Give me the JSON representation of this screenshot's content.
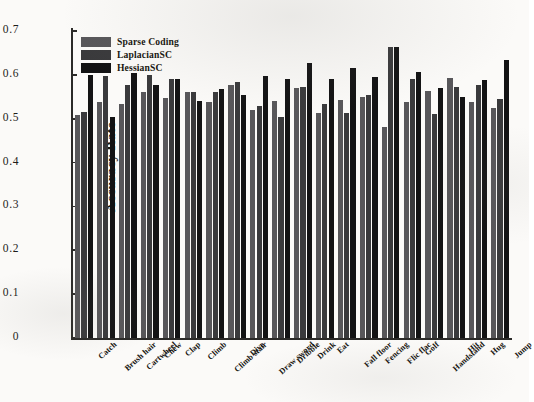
{
  "chart_data": {
    "type": "bar",
    "title": "",
    "subtitle": "",
    "xlabel": "",
    "ylabel": "Accuracy Rate",
    "ylim": [
      0,
      0.7
    ],
    "yticks": [
      "0",
      "0.1",
      "0.2",
      "0.3",
      "0.4",
      "0.5",
      "0.6",
      "0.7"
    ],
    "ytick_values": [
      0,
      0.1,
      0.2,
      0.3,
      0.4,
      0.5,
      0.6,
      0.7
    ],
    "grid": false,
    "legend_position": "top-left",
    "categories": [
      "Catch",
      "Brush hair",
      "Cartwheel",
      "Chew",
      "Clap",
      "Climb",
      "Climb stair",
      "Dive",
      "Draw sword",
      "Dribble",
      "Drink",
      "Eat",
      "Fall floor",
      "Fencing",
      "Flic flac",
      "Golf",
      "Handstand",
      "Hit",
      "Hug",
      "Jump"
    ],
    "series": [
      {
        "name": "Sparse Coding",
        "color": "#58575a",
        "values": [
          0.508,
          0.538,
          0.533,
          0.561,
          0.548,
          0.562,
          0.538,
          0.578,
          0.52,
          0.54,
          0.57,
          0.512,
          0.542,
          0.55,
          0.482,
          0.538,
          0.563,
          0.594,
          0.538,
          0.525
        ]
      },
      {
        "name": "LaplacianSC",
        "color": "#3a3a3c",
        "values": [
          0.515,
          0.597,
          0.578,
          0.6,
          0.59,
          0.562,
          0.562,
          0.583,
          0.528,
          0.505,
          0.573,
          0.533,
          0.512,
          0.553,
          0.663,
          0.59,
          0.51,
          0.572,
          0.577,
          0.545
        ]
      },
      {
        "name": "HessianSC",
        "color": "#131314",
        "values": [
          0.6,
          0.505,
          0.605,
          0.578,
          0.59,
          0.54,
          0.568,
          0.555,
          0.597,
          0.59,
          0.628,
          0.59,
          0.615,
          0.595,
          0.663,
          0.607,
          0.57,
          0.55,
          0.588,
          0.635
        ]
      }
    ]
  },
  "legend": {
    "items": [
      {
        "label": "Sparse Coding",
        "color": "#58575a"
      },
      {
        "label": "LaplacianSC",
        "color": "#3a3a3c"
      },
      {
        "label": "HessianSC",
        "color": "#131314"
      }
    ]
  },
  "axis": {
    "y_title": "Accuracy Rate"
  }
}
